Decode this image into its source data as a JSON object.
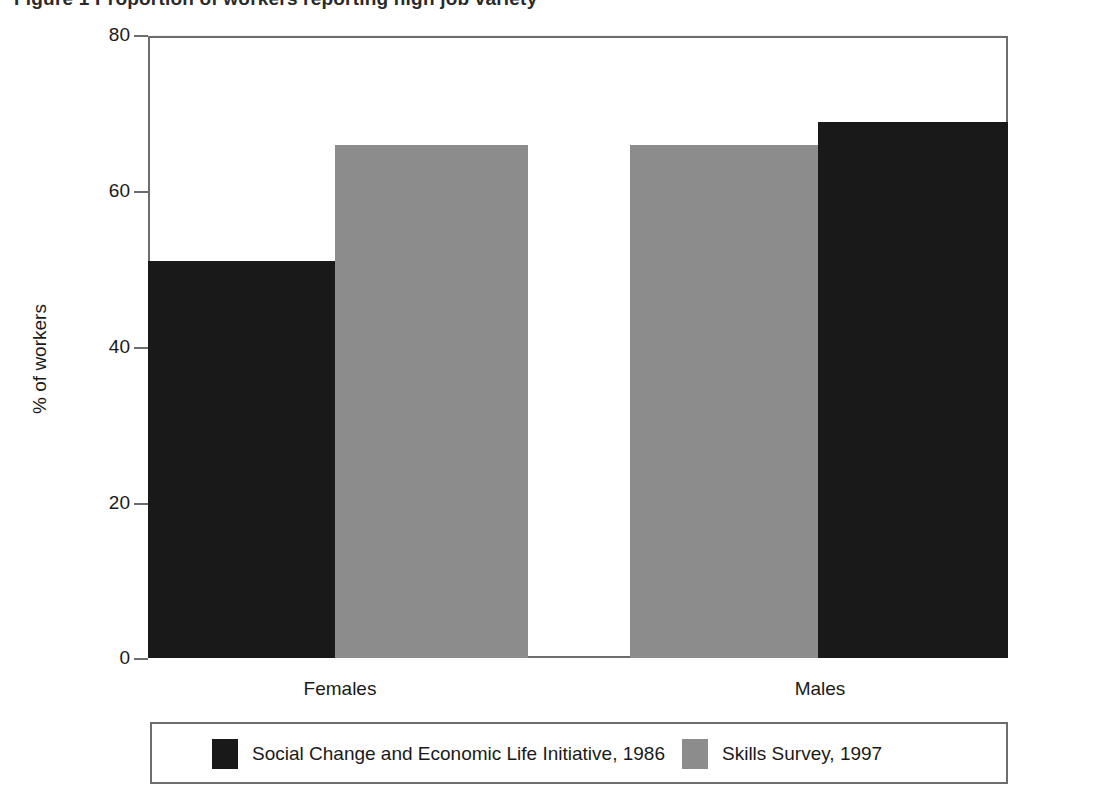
{
  "figure": {
    "title_clipped": "Figure 1   Proportion of workers reporting high job variety"
  },
  "axes": {
    "y_title": "% of workers",
    "y_ticks": [
      0,
      20,
      40,
      60,
      80
    ],
    "y_tick_labels": [
      "0",
      "20",
      "40",
      "60",
      "80"
    ],
    "x_categories": [
      "Females",
      "Males"
    ]
  },
  "legend": {
    "entries": [
      {
        "label": "Social Change and Economic Life Initiative, 1986",
        "color": "#191919",
        "swatch": "dark"
      },
      {
        "label": "Skills Survey, 1997",
        "color": "#8c8c8c",
        "swatch": "light"
      }
    ]
  },
  "colors": {
    "series_1986": "#191919",
    "series_1997": "#8c8c8c",
    "frame": "#6d6d6d",
    "background": "#ffffff",
    "text": "#1a1a1a"
  },
  "chart_data": {
    "type": "bar",
    "title": "Figure 1   Proportion of workers reporting high job variety",
    "xlabel": "",
    "ylabel": "% of workers",
    "ylim": [
      0,
      80
    ],
    "yticks": [
      0,
      20,
      40,
      60,
      80
    ],
    "grid": false,
    "legend_position": "bottom",
    "categories": [
      "Females",
      "Males"
    ],
    "series": [
      {
        "name": "Social Change and Economic Life Initiative, 1986",
        "color": "#191919",
        "values": [
          51,
          69
        ]
      },
      {
        "name": "Skills Survey, 1997",
        "color": "#8c8c8c",
        "values": [
          66,
          66
        ]
      }
    ]
  }
}
